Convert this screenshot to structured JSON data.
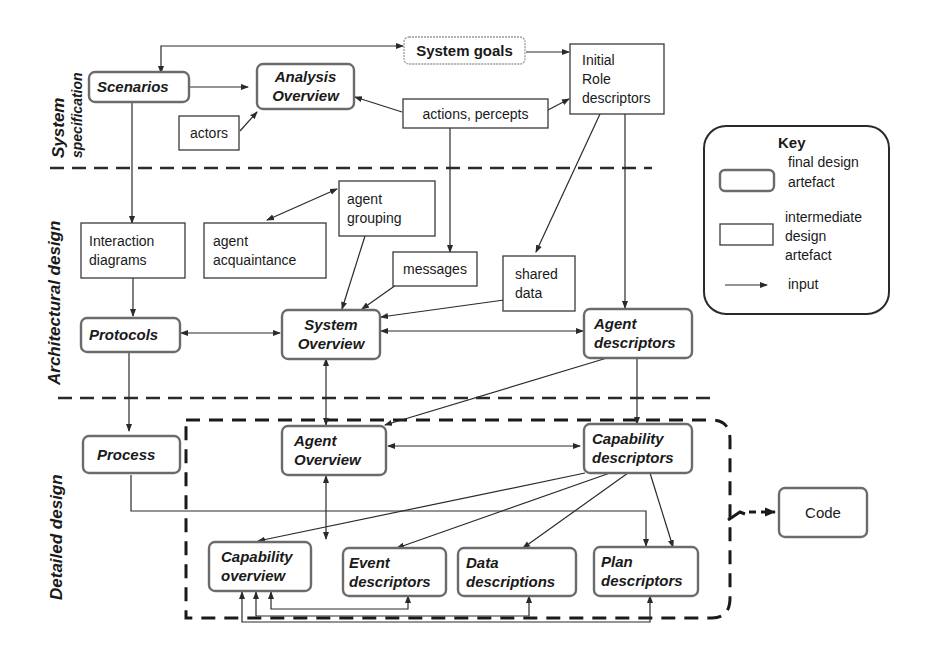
{
  "sections": {
    "system_specification": [
      "System",
      "specification"
    ],
    "architectural_design": "Architectural design",
    "detailed_design": "Detailed design"
  },
  "nodes": {
    "scenarios": {
      "lines": [
        "Scenarios"
      ],
      "kind": "final"
    },
    "analysis_overview": {
      "lines": [
        "Analysis",
        "Overview"
      ],
      "kind": "final"
    },
    "system_goals": {
      "lines": [
        "System goals"
      ],
      "kind": "goal"
    },
    "initial_role_descriptors": {
      "lines": [
        "Initial",
        "Role",
        "descriptors"
      ],
      "kind": "intermediate"
    },
    "actors": {
      "lines": [
        "actors"
      ],
      "kind": "intermediate"
    },
    "actions_percepts": {
      "lines": [
        "actions, percepts"
      ],
      "kind": "intermediate"
    },
    "interaction_diagrams": {
      "lines": [
        "Interaction",
        "diagrams"
      ],
      "kind": "intermediate"
    },
    "agent_acquaintance": {
      "lines": [
        "agent",
        "acquaintance"
      ],
      "kind": "intermediate"
    },
    "agent_grouping": {
      "lines": [
        "agent",
        "grouping"
      ],
      "kind": "intermediate"
    },
    "messages": {
      "lines": [
        "messages"
      ],
      "kind": "intermediate"
    },
    "shared_data": {
      "lines": [
        "shared",
        "data"
      ],
      "kind": "intermediate"
    },
    "protocols": {
      "lines": [
        "Protocols"
      ],
      "kind": "final"
    },
    "system_overview": {
      "lines": [
        "System",
        "Overview"
      ],
      "kind": "final"
    },
    "agent_descriptors": {
      "lines": [
        "Agent",
        "descriptors"
      ],
      "kind": "final"
    },
    "process": {
      "lines": [
        "Process"
      ],
      "kind": "final"
    },
    "agent_overview": {
      "lines": [
        "Agent",
        "Overview"
      ],
      "kind": "final"
    },
    "capability_descriptors": {
      "lines": [
        "Capability",
        "descriptors"
      ],
      "kind": "final"
    },
    "capability_overview": {
      "lines": [
        "Capability",
        "overview"
      ],
      "kind": "final"
    },
    "event_descriptors": {
      "lines": [
        "Event",
        "descriptors"
      ],
      "kind": "final"
    },
    "data_descriptions": {
      "lines": [
        "Data",
        "descriptions"
      ],
      "kind": "final"
    },
    "plan_descriptors": {
      "lines": [
        "Plan",
        "descriptors"
      ],
      "kind": "final"
    },
    "code": {
      "lines": [
        "Code"
      ],
      "kind": "final"
    }
  },
  "edges": [
    [
      "scenarios",
      "system_goals",
      "both"
    ],
    [
      "scenarios",
      "analysis_overview",
      "forward"
    ],
    [
      "actors",
      "analysis_overview",
      "forward"
    ],
    [
      "actions_percepts",
      "analysis_overview",
      "forward"
    ],
    [
      "system_goals",
      "initial_role_descriptors",
      "forward"
    ],
    [
      "actions_percepts",
      "initial_role_descriptors",
      "forward"
    ],
    [
      "scenarios",
      "interaction_diagrams",
      "forward"
    ],
    [
      "actions_percepts",
      "messages",
      "forward"
    ],
    [
      "initial_role_descriptors",
      "shared_data",
      "forward"
    ],
    [
      "initial_role_descriptors",
      "agent_descriptors",
      "forward"
    ],
    [
      "agent_grouping",
      "agent_acquaintance",
      "both"
    ],
    [
      "agent_grouping",
      "system_overview",
      "forward"
    ],
    [
      "messages",
      "system_overview",
      "forward"
    ],
    [
      "shared_data",
      "system_overview",
      "forward"
    ],
    [
      "interaction_diagrams",
      "protocols",
      "forward"
    ],
    [
      "protocols",
      "system_overview",
      "both"
    ],
    [
      "system_overview",
      "agent_descriptors",
      "both"
    ],
    [
      "protocols",
      "process",
      "forward"
    ],
    [
      "system_overview",
      "agent_overview",
      "both"
    ],
    [
      "agent_descriptors",
      "agent_overview",
      "forward"
    ],
    [
      "agent_descriptors",
      "capability_descriptors",
      "forward"
    ],
    [
      "agent_overview",
      "capability_descriptors",
      "both"
    ],
    [
      "agent_overview",
      "capability_overview",
      "both"
    ],
    [
      "capability_descriptors",
      "capability_overview",
      "forward"
    ],
    [
      "capability_descriptors",
      "event_descriptors",
      "forward"
    ],
    [
      "capability_descriptors",
      "data_descriptions",
      "forward"
    ],
    [
      "capability_descriptors",
      "plan_descriptors",
      "forward"
    ],
    [
      "process",
      "plan_descriptors",
      "forward"
    ],
    [
      "capability_overview",
      "event_descriptors",
      "both"
    ],
    [
      "capability_overview",
      "data_descriptions",
      "both"
    ],
    [
      "capability_overview",
      "plan_descriptors",
      "both"
    ],
    [
      "detailed_design_group",
      "code",
      "dashed"
    ]
  ],
  "key": {
    "title": "Key",
    "final_label": [
      "final design",
      "artefact"
    ],
    "intermediate_label": [
      "intermediate",
      "design",
      "artefact"
    ],
    "input_label": "input"
  }
}
